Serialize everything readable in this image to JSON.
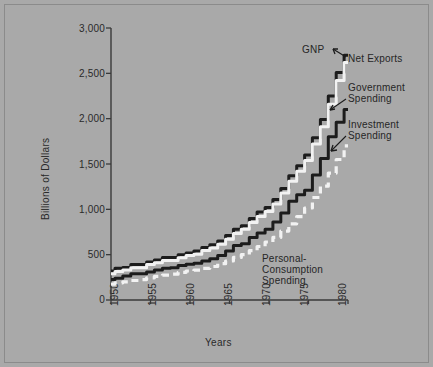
{
  "figure": {
    "background_color": "#a9a9a9",
    "frame_color": "#8b8b8b",
    "line_dark_color": "#1c1c1c",
    "line_light_color": "#f2f2f2"
  },
  "annotations": {
    "gnp": "GNP",
    "net_exports": "Net Exports",
    "government_spending_l1": "Government",
    "government_spending_l2": "Spending",
    "investment_spending_l1": "Investment",
    "investment_spending_l2": "Spending",
    "personal_l1": "Personal-",
    "personal_l2": "Consumption",
    "personal_l3": "Spending"
  },
  "chart_data": {
    "type": "line",
    "title": "",
    "xlabel": "Years",
    "ylabel": "Billions of Dollars",
    "xlim": [
      1950,
      1980
    ],
    "ylim": [
      0,
      3000
    ],
    "grid": false,
    "legend": "inline-annotations",
    "xticks": [
      1950,
      1955,
      1960,
      1965,
      1970,
      1975,
      1980
    ],
    "xtick_labels": [
      "1950",
      "1955",
      "1960",
      "1965",
      "1970",
      "1975",
      "1980"
    ],
    "yticks": [
      0,
      500,
      1000,
      1500,
      2000,
      2500,
      3000
    ],
    "ytick_labels": [
      "0",
      "500",
      "1,000",
      "1,500",
      "2,000",
      "2,500",
      "3,000"
    ],
    "x": [
      1950,
      1951,
      1952,
      1953,
      1954,
      1955,
      1956,
      1957,
      1958,
      1959,
      1960,
      1961,
      1962,
      1963,
      1964,
      1965,
      1966,
      1967,
      1968,
      1969,
      1970,
      1971,
      1972,
      1973,
      1974,
      1975,
      1976,
      1977,
      1978,
      1979,
      1980
    ],
    "series": [
      {
        "name": "GNP",
        "style": "solid",
        "color": "#1c1c1c",
        "values": [
          320,
          350,
          360,
          390,
          390,
          420,
          440,
          470,
          470,
          500,
          520,
          540,
          580,
          610,
          650,
          710,
          780,
          820,
          900,
          970,
          1020,
          1110,
          1230,
          1370,
          1480,
          1600,
          1790,
          1990,
          2250,
          2510,
          2700
        ]
      },
      {
        "name": "Net Exports",
        "style": "solid",
        "color": "#f2f2f2",
        "values": [
          290,
          315,
          330,
          355,
          355,
          390,
          410,
          435,
          435,
          465,
          490,
          505,
          545,
          575,
          615,
          670,
          735,
          780,
          855,
          920,
          975,
          1060,
          1180,
          1310,
          1420,
          1540,
          1720,
          1910,
          2160,
          2420,
          2620
        ]
      },
      {
        "name": "Government Spending",
        "style": "solid",
        "color": "#1c1c1c",
        "values": [
          225,
          240,
          265,
          290,
          290,
          310,
          330,
          350,
          355,
          380,
          395,
          405,
          430,
          455,
          490,
          540,
          600,
          620,
          690,
          740,
          780,
          860,
          960,
          1090,
          1160,
          1210,
          1380,
          1560,
          1800,
          1960,
          2100
        ]
      },
      {
        "name": "Personal-Consumption Spending",
        "style": "dashed",
        "color": "#f2f2f2",
        "values": [
          175,
          190,
          200,
          215,
          225,
          245,
          260,
          275,
          285,
          305,
          320,
          330,
          350,
          370,
          400,
          430,
          470,
          500,
          545,
          590,
          640,
          690,
          760,
          840,
          920,
          1015,
          1130,
          1255,
          1400,
          1550,
          1700
        ]
      }
    ]
  }
}
